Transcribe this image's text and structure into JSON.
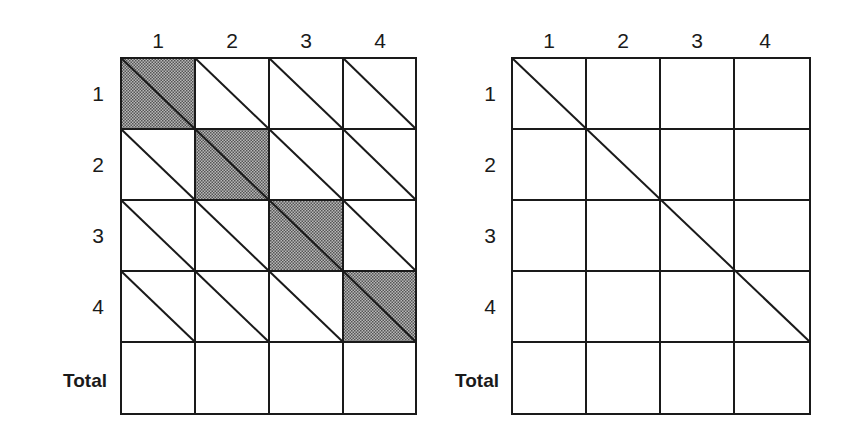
{
  "left_grid": {
    "column_headers": [
      "1",
      "2",
      "3",
      "4"
    ],
    "row_headers": [
      "1",
      "2",
      "3",
      "4",
      "Total"
    ],
    "shaded_cells": "diagonal",
    "shade_color": "#8a8a8a"
  },
  "right_grid": {
    "column_headers": [
      "1",
      "2",
      "3",
      "4"
    ],
    "row_headers": [
      "1",
      "2",
      "3",
      "4",
      "Total"
    ],
    "diagonal_line": "single line from top-left corner through 4x4 block"
  },
  "colors": {
    "line": "#1a1a1a",
    "background": "#ffffff"
  }
}
